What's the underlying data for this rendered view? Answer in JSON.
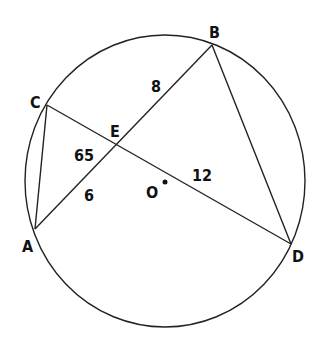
{
  "diagram": {
    "circle": {
      "center_label": "O"
    },
    "points": {
      "A": "A",
      "B": "B",
      "C": "C",
      "D": "D",
      "E": "E"
    },
    "measures": {
      "angle_CEA": "65",
      "EA": "6",
      "EB": "8",
      "ED": "12"
    }
  }
}
